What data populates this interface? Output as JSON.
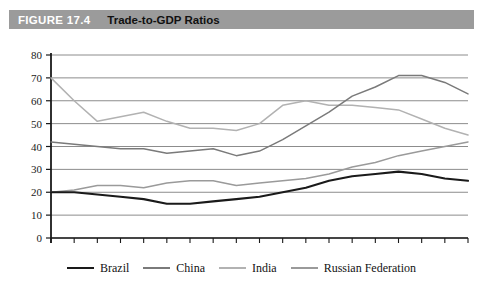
{
  "header": {
    "figure_number": "FIGURE 17.4",
    "title": "Trade-to-GDP Ratios",
    "bar_color": "#9b9b9b",
    "number_color": "#ffffff",
    "title_color": "#111111"
  },
  "chart_data": {
    "type": "line",
    "title": "Trade-to-GDP Ratios",
    "xlabel": "",
    "ylabel": "",
    "ylim": [
      0,
      80
    ],
    "ytick_step": 10,
    "yticks": [
      "0",
      "10",
      "20",
      "30",
      "40",
      "50",
      "60",
      "70",
      "80"
    ],
    "grid": true,
    "grid_color": "#8c8c8c",
    "legend_position": "bottom",
    "x": [
      1993,
      1994,
      1995,
      1996,
      1997,
      1998,
      1999,
      2000,
      2001,
      2002,
      2003,
      2004,
      2005,
      2006,
      2007,
      2008,
      2009,
      2010,
      2011
    ],
    "xticks_labeled": [
      "1993",
      "1997",
      "2001",
      "2005",
      "2009"
    ],
    "xlim": [
      1993,
      2011
    ],
    "series": [
      {
        "name": "Brazil",
        "color": "#1a1a1a",
        "width": 2.1,
        "values": [
          20,
          20,
          19,
          18,
          17,
          15,
          15,
          16,
          17,
          18,
          20,
          22,
          25,
          27,
          28,
          29,
          28,
          26,
          25
        ]
      },
      {
        "name": "China",
        "color": "#7a7a7a",
        "width": 1.5,
        "values": [
          42,
          41,
          40,
          39,
          39,
          37,
          38,
          39,
          36,
          38,
          43,
          49,
          55,
          62,
          66,
          71,
          71,
          68,
          63
        ]
      },
      {
        "name": "India",
        "color": "#b2b2b2",
        "width": 1.5,
        "values": [
          70,
          60,
          51,
          53,
          55,
          51,
          48,
          48,
          47,
          50,
          58,
          60,
          58,
          58,
          57,
          56,
          52,
          48,
          45
        ]
      },
      {
        "name": "Russian Federation",
        "color": "#9a9a9a",
        "width": 1.5,
        "values": [
          20,
          21,
          23,
          23,
          22,
          24,
          25,
          25,
          23,
          24,
          25,
          26,
          28,
          31,
          33,
          36,
          38,
          40,
          42
        ]
      }
    ]
  },
  "legend": {
    "items": [
      {
        "label": "Brazil",
        "color": "#1a1a1a"
      },
      {
        "label": "China",
        "color": "#7a7a7a"
      },
      {
        "label": "India",
        "color": "#b2b2b2"
      },
      {
        "label": "Russian Federation",
        "color": "#9a9a9a"
      }
    ]
  }
}
